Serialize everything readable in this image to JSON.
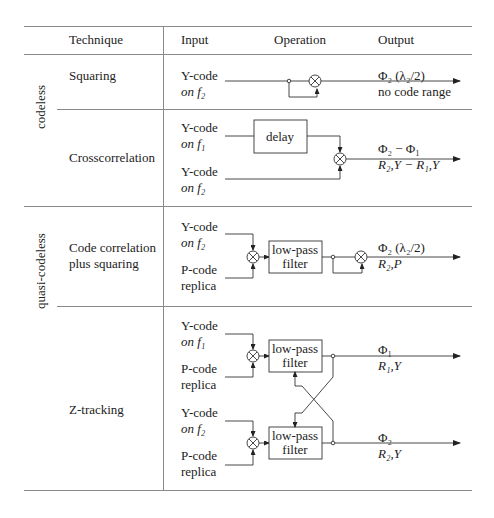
{
  "header": {
    "technique": "Technique",
    "input": "Input",
    "operation": "Operation",
    "output": "Output"
  },
  "groups": {
    "codeless": "codeless",
    "quasi_codeless": "quasi-codeless"
  },
  "rows": [
    {
      "technique": "Squaring",
      "inputs": [
        {
          "line1": "Y-code",
          "line2": "on f₂"
        }
      ],
      "output": {
        "line1": "Φ₂ (λ₂/2)",
        "line2": "no code range"
      }
    },
    {
      "technique": "Crosscorrelation",
      "inputs": [
        {
          "line1": "Y-code",
          "line2": "on f₁"
        },
        {
          "line1": "Y-code",
          "line2": "on f₂"
        }
      ],
      "box": "delay",
      "output": {
        "line1": "Φ₂ − Φ₁",
        "line2": "R₂,Y − R₁,Y"
      }
    },
    {
      "technique_line1": "Code correlation",
      "technique_line2": "plus squaring",
      "inputs": [
        {
          "line1": "Y-code",
          "line2": "on f₂"
        },
        {
          "line1": "P-code",
          "line2": "replica"
        }
      ],
      "box_line1": "low-pass",
      "box_line2": "filter",
      "output": {
        "line1": "Φ₂ (λ₂/2)",
        "line2": "R₂,P"
      }
    },
    {
      "technique": "Z-tracking",
      "inputs": [
        {
          "line1": "Y-code",
          "line2": "on f₁"
        },
        {
          "line1": "P-code",
          "line2": "replica"
        },
        {
          "line1": "Y-code",
          "line2": "on f₂"
        },
        {
          "line1": "P-code",
          "line2": "replica"
        }
      ],
      "box_line1": "low-pass",
      "box_line2": "filter",
      "outputs": [
        {
          "line1": "Φ₁",
          "line2": "R₁,Y"
        },
        {
          "line1": "Φ₂",
          "line2": "R₂,Y"
        }
      ]
    }
  ],
  "icons": {
    "mixer": "circled-times",
    "arrow": "arrowhead"
  }
}
